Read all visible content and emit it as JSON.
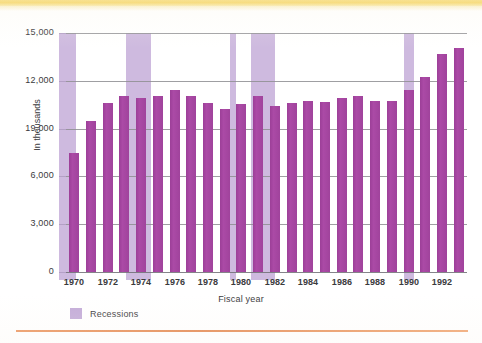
{
  "page": {
    "top_rule_color": "#f5d257",
    "bottom_rule_color": "#e07a3c"
  },
  "chart_data": {
    "type": "bar",
    "title": "",
    "xlabel": "Fiscal year",
    "ylabel": "In thousands",
    "ylim": [
      0,
      15000
    ],
    "grid": true,
    "legend_position": "below-left",
    "bar_color": "#a4459f",
    "recession_color": "#c3abd8",
    "y_ticks": [
      0,
      3000,
      6000,
      9000,
      12000,
      15000
    ],
    "y_tick_labels": [
      "0",
      "3,000",
      "6,000",
      "19,000",
      "12,000",
      "15,000"
    ],
    "x_tick_labels": [
      "1970",
      "1972",
      "1974",
      "1976",
      "1978",
      "1980",
      "1982",
      "1984",
      "1986",
      "1988",
      "1990",
      "1992"
    ],
    "categories": [
      "1970",
      "1971",
      "1972",
      "1973",
      "1974",
      "1975",
      "1976",
      "1977",
      "1978",
      "1979",
      "1980",
      "1981",
      "1982",
      "1983",
      "1984",
      "1985",
      "1986",
      "1987",
      "1988",
      "1989",
      "1990",
      "1991",
      "1992",
      "1993"
    ],
    "values": [
      7450,
      9450,
      10600,
      11050,
      10900,
      11050,
      11400,
      11050,
      10600,
      10250,
      10550,
      11050,
      10400,
      10600,
      10750,
      10700,
      10900,
      11050,
      10750,
      10750,
      11450,
      12250,
      13700,
      14050
    ],
    "series": [
      {
        "name": "Fiscal year total",
        "values": [
          7450,
          9450,
          10600,
          11050,
          10900,
          11050,
          11400,
          11050,
          10600,
          10250,
          10550,
          11050,
          10400,
          10600,
          10750,
          10700,
          10900,
          11050,
          10750,
          10750,
          11450,
          12250,
          13700,
          14050
        ]
      }
    ],
    "recessions": [
      {
        "label": "1970 recession",
        "start_year": 1969.6,
        "end_year": 1970.6
      },
      {
        "label": "1973-75 recession",
        "start_year": 1973.6,
        "end_year": 1975.1
      },
      {
        "label": "1980 recession",
        "start_year": 1979.8,
        "end_year": 1980.1
      },
      {
        "label": "1981-82 recession",
        "start_year": 1981.1,
        "end_year": 1982.5
      },
      {
        "label": "1990-91 recession",
        "start_year": 1990.2,
        "end_year": 1990.8
      }
    ],
    "legend": [
      {
        "label": "Recessions",
        "color": "#c3abd8"
      }
    ]
  }
}
